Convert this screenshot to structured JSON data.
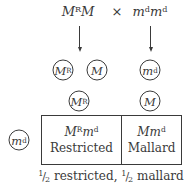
{
  "diagram": {
    "type": "punnett-square-cross",
    "parents": {
      "left": {
        "base1": "M",
        "sup1": "R",
        "base2": "M",
        "sup2": ""
      },
      "operator": "×",
      "right": {
        "base1": "m",
        "sup1": "d",
        "base2": "m",
        "sup2": "d"
      }
    },
    "gametes_row1": [
      {
        "base": "M",
        "sup": "R"
      },
      {
        "base": "M",
        "sup": ""
      },
      {
        "base": "m",
        "sup": "d"
      }
    ],
    "grid": {
      "column_headers": [
        {
          "base": "M",
          "sup": "R"
        },
        {
          "base": "M",
          "sup": ""
        }
      ],
      "row_headers": [
        {
          "base": "m",
          "sup": "d"
        }
      ],
      "cells": [
        {
          "genotype": {
            "b1": "M",
            "s1": "R",
            "b2": "m",
            "s2": "d"
          },
          "phenotype": "Restricted"
        },
        {
          "genotype": {
            "b1": "M",
            "s1": "",
            "b2": "m",
            "s2": "d"
          },
          "phenotype": "Mallard"
        }
      ]
    },
    "caption": {
      "frac1_num": "1",
      "frac1_den": "2",
      "text1": " restricted, ",
      "frac2_num": "1",
      "frac2_den": "2",
      "text2": " mallard"
    }
  }
}
